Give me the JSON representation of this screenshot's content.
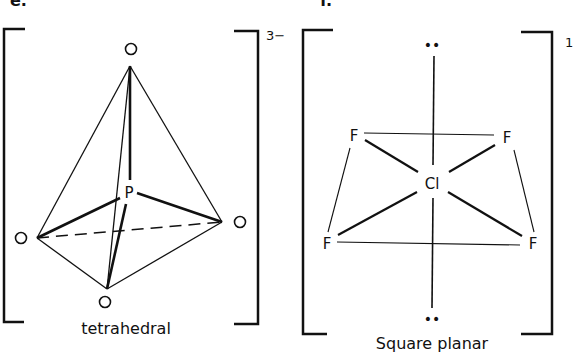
{
  "panels": [
    {
      "id": "e",
      "label": "e.",
      "charge": "3−",
      "geometry_label": "tetrahedral",
      "central_atom": "P",
      "ligands": [
        "O",
        "O",
        "O",
        "O"
      ]
    },
    {
      "id": "f",
      "label": "f.",
      "charge": "1",
      "geometry_label": "Square planar",
      "central_atom": "Cl",
      "ligands": [
        "F",
        "F",
        "F",
        "F"
      ],
      "lone_pairs": [
        "••",
        "••"
      ]
    }
  ],
  "colors": {
    "ink": "#111111",
    "background": "#ffffff"
  }
}
